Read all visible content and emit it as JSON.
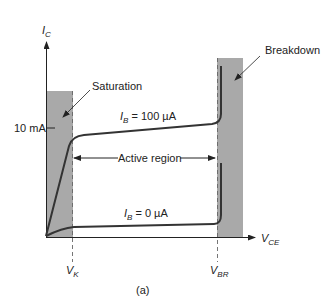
{
  "figure": {
    "caption": "(a)",
    "colors": {
      "region_fill": "#a9a9a9",
      "curve": "#333333",
      "axis": "#222222",
      "dashed": "#666666"
    },
    "axes": {
      "y_label_main": "I",
      "y_label_sub": "C",
      "x_label_main": "V",
      "x_label_sub": "CE",
      "y_tick_label": "10 mA"
    },
    "markers": {
      "vk_main": "V",
      "vk_sub": "K",
      "vbr_main": "V",
      "vbr_sub": "BR"
    },
    "regions": {
      "saturation": "Saturation",
      "breakdown": "Breakdown",
      "active": "Active region"
    },
    "curves": [
      {
        "label_main": "I",
        "label_sub": "B",
        "label_value": " = 100 µA"
      },
      {
        "label_main": "I",
        "label_sub": "B",
        "label_value": " = 0 µA"
      }
    ]
  }
}
